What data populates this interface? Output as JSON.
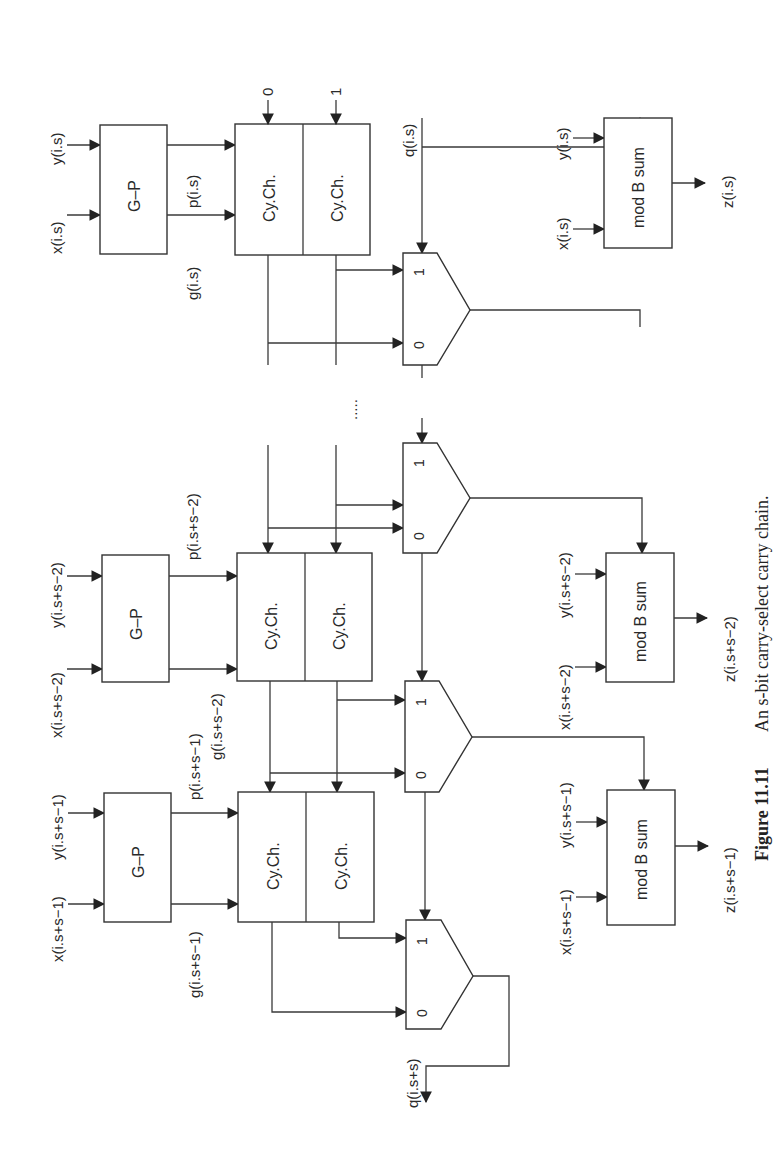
{
  "figure": {
    "caption_number": "Figure 11.11",
    "caption_text": "An s-bit carry-select carry chain.",
    "orientation": "rotated 90° counter-clockwise"
  },
  "blocks": {
    "gp": "G–P",
    "cych": "Cy.Ch.",
    "modb": "mod B sum",
    "mux_in1": "1",
    "mux_in0": "0"
  },
  "stages": [
    {
      "x_in": "x(i.s)",
      "y_in": "y(i.s)",
      "g_out": "g(i.s)",
      "p_out": "p(i.s)",
      "carry_in0": "0",
      "carry_in1": "1",
      "q_in": "q(i.s)",
      "sum_x": "x(i.s)",
      "sum_y": "y(i.s)",
      "z_out": "z(i.s)"
    },
    {
      "x_in": "x(i.s+s−2)",
      "y_in": "y(i.s+s−2)",
      "g_out": "g(i.s+s−2)",
      "p_out": "p(i.s+s−2)",
      "sum_x": "x(i.s+s−2)",
      "sum_y": "y(i.s+s−2)",
      "z_out": "z(i.s+s−2)"
    },
    {
      "x_in": "x(i.s+s−1)",
      "y_in": "y(i.s+s−1)",
      "g_out": "g(i.s+s−1)",
      "p_out": "p(i.s+s−1)",
      "sum_x": "x(i.s+s−1)",
      "sum_y": "y(i.s+s−1)",
      "z_out": "z(i.s+s−1)",
      "q_out": "q(i.s+s)"
    }
  ],
  "ellipsis": "....."
}
